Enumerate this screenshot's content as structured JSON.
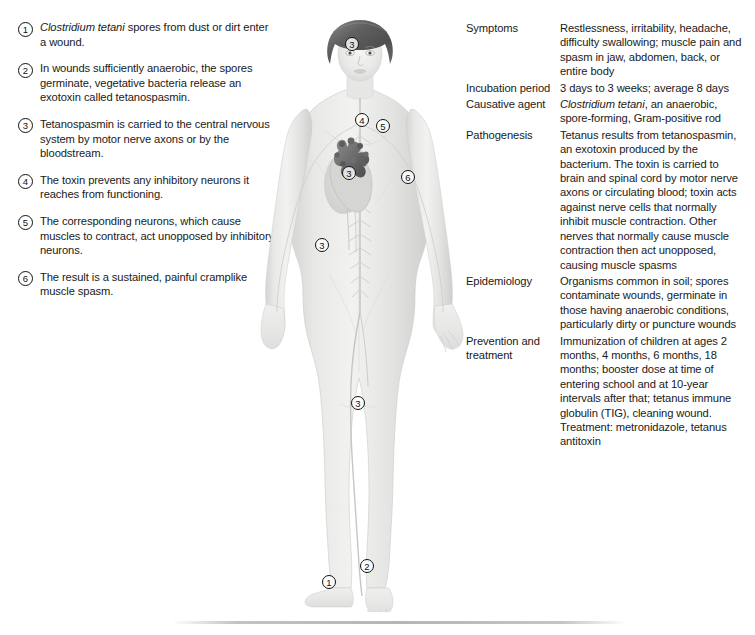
{
  "steps": [
    {
      "num": "1",
      "html": "<i>Clostridium tetani</i> spores from dust or dirt enter a wound."
    },
    {
      "num": "2",
      "html": "In wounds sufficiently anaerobic, the spores germinate, vegetative bacteria release an exotoxin called tetanospasmin."
    },
    {
      "num": "3",
      "html": "Tetanospasmin is carried to the central nervous system by motor nerve axons or by the bloodstream."
    },
    {
      "num": "4",
      "html": "The toxin prevents any inhibitory neurons it reaches from functioning."
    },
    {
      "num": "5",
      "html": "The corresponding neurons, which cause muscles to contract, act unopposed by inhibitory neurons."
    },
    {
      "num": "6",
      "html": "The result is a sustained, painful cramplike muscle spasm."
    }
  ],
  "figure": {
    "illustration_name": "human-body-anterior-nervous-system",
    "callouts": [
      {
        "label": "3",
        "x": 90,
        "y": 25,
        "name": "callout-head-3"
      },
      {
        "label": "4",
        "x": 100,
        "y": 101,
        "name": "callout-shoulder-4"
      },
      {
        "label": "5",
        "x": 121,
        "y": 107,
        "name": "callout-shoulder-5"
      },
      {
        "label": "3",
        "x": 87,
        "y": 154,
        "name": "callout-heart-3"
      },
      {
        "label": "6",
        "x": 146,
        "y": 158,
        "name": "callout-arm-6"
      },
      {
        "label": "3",
        "x": 60,
        "y": 226,
        "name": "callout-abdomen-3"
      },
      {
        "label": "3",
        "x": 96,
        "y": 384,
        "name": "callout-leg-3"
      },
      {
        "label": "2",
        "x": 105,
        "y": 547,
        "name": "callout-foot-2"
      },
      {
        "label": "1",
        "x": 67,
        "y": 563,
        "name": "callout-foot-1"
      }
    ]
  },
  "facts": [
    {
      "label": "Symptoms",
      "html": "Restlessness, irritability, headache, difficulty swallowing; muscle pain and spasm in jaw, abdomen, back, or entire body"
    },
    {
      "label": "Incubation period",
      "html": "3 days to 3 weeks; average 8 days"
    },
    {
      "label": "Causative agent",
      "html": "<i>Clostridium tetani</i>, an anaerobic, spore-forming, Gram-positive rod"
    },
    {
      "label": "Pathogenesis",
      "html": "Tetanus results from tetanospasmin, an exotoxin produced by the bacterium. The toxin is carried to brain and spinal cord by motor nerve axons or circulating blood; toxin acts against nerve cells that normally inhibit muscle contraction. Other nerves that normally cause muscle contraction then act unopposed, causing muscle spasms"
    },
    {
      "label": "Epidemiology",
      "html": "Organisms common in soil; spores contaminate wounds, germinate in those having anaerobic conditions, particularly dirty or puncture wounds"
    },
    {
      "label": "Prevention and treatment",
      "html": "Immunization of children at ages 2 months, 4 months, 6 months, 18 months; booster dose at time of entering school and at 10-year intervals after that; tetanus immune globulin (TIG), cleaning wound. Treatment: metronidazole, tetanus antitoxin"
    }
  ],
  "colors": {
    "text": "#1a1a1a",
    "skin_light": "#eeeeec",
    "skin_mid": "#dcdcda",
    "skin_shadow": "#c6c6c4",
    "hair": "#6e6e6e",
    "heart": "#7a7a7a",
    "rule": "#a8a8a8"
  }
}
